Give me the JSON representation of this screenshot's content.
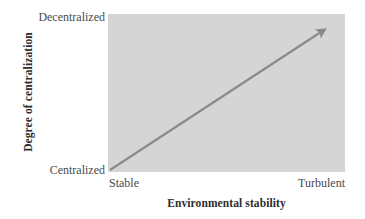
{
  "chart_data": {
    "type": "line",
    "title": "",
    "subtitle": "",
    "xlabel": "Environmental stability",
    "ylabel": "Degree of centralization",
    "x_tick_labels": [
      "Stable",
      "Turbulent"
    ],
    "y_tick_labels": [
      "Centralized",
      "Decentralized"
    ],
    "xlim": [
      0,
      1
    ],
    "ylim": [
      0,
      1
    ],
    "grid": false,
    "legend": null,
    "legend_position": "none",
    "annotations": [],
    "series": [
      {
        "name": "centralization-trend",
        "style": "arrow",
        "x": [
          0,
          1
        ],
        "values": [
          0,
          1
        ],
        "color": "#8a8a8a",
        "line_width": 2,
        "arrowhead": "end"
      }
    ],
    "plot_background": "#d5d5d5",
    "figure_background": "#ffffff"
  },
  "axes": {
    "y": {
      "title": "Degree of centralization",
      "tick_top": "Decentralized",
      "tick_bottom": "Centralized"
    },
    "x": {
      "title": "Environmental stability",
      "tick_left": "Stable",
      "tick_right": "Turbulent"
    }
  }
}
